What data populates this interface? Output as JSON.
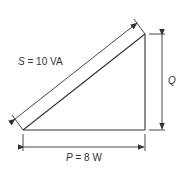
{
  "diagram": {
    "apparent_power": {
      "symbol": "S",
      "eq": "=",
      "value": "10 VA"
    },
    "real_power": {
      "symbol": "P",
      "eq": "=",
      "value": "8 W"
    },
    "reactive_power": {
      "symbol": "Q"
    },
    "colors": {
      "line": "#333333",
      "background": "#ffffff"
    }
  }
}
